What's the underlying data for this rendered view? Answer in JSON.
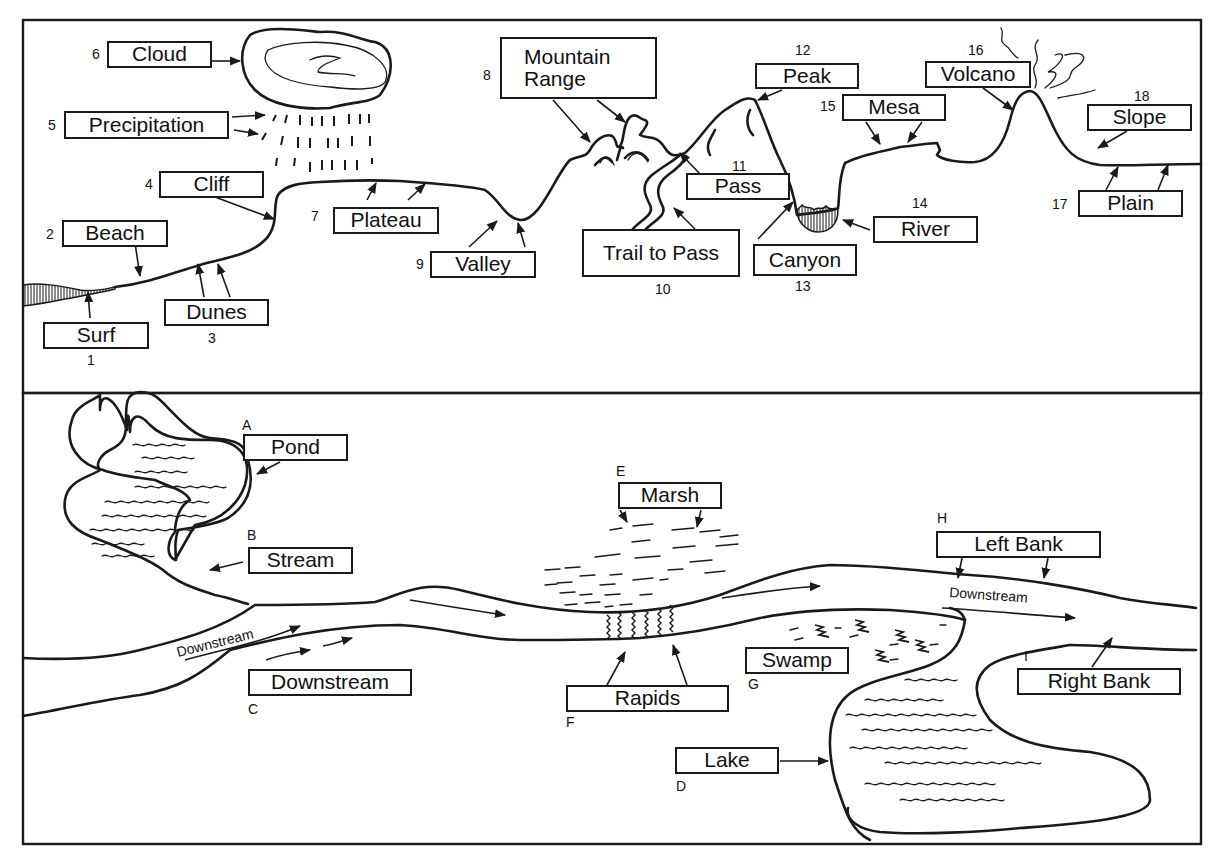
{
  "top_panel": {
    "labels": [
      {
        "num": "1",
        "text": "Surf"
      },
      {
        "num": "2",
        "text": "Beach"
      },
      {
        "num": "3",
        "text": "Dunes"
      },
      {
        "num": "4",
        "text": "Cliff"
      },
      {
        "num": "5",
        "text": "Precipitation"
      },
      {
        "num": "6",
        "text": "Cloud"
      },
      {
        "num": "7",
        "text": "Plateau"
      },
      {
        "num": "8",
        "text": "Mountain Range",
        "line1": "Mountain",
        "line2": "Range"
      },
      {
        "num": "9",
        "text": "Valley"
      },
      {
        "num": "10",
        "text": "Trail to Pass"
      },
      {
        "num": "11",
        "text": "Pass"
      },
      {
        "num": "12",
        "text": "Peak"
      },
      {
        "num": "13",
        "text": "Canyon"
      },
      {
        "num": "14",
        "text": "River"
      },
      {
        "num": "15",
        "text": "Mesa"
      },
      {
        "num": "16",
        "text": "Volcano"
      },
      {
        "num": "17",
        "text": "Plain"
      },
      {
        "num": "18",
        "text": "Slope"
      }
    ]
  },
  "bottom_panel": {
    "labels": [
      {
        "letter": "A",
        "text": "Pond"
      },
      {
        "letter": "B",
        "text": "Stream"
      },
      {
        "letter": "C",
        "text": "Downstream"
      },
      {
        "letter": "D",
        "text": "Lake"
      },
      {
        "letter": "E",
        "text": "Marsh"
      },
      {
        "letter": "F",
        "text": "Rapids"
      },
      {
        "letter": "G",
        "text": "Swamp"
      },
      {
        "letter": "H",
        "text": "Left Bank"
      },
      {
        "letter": "I",
        "text": "Right Bank"
      }
    ],
    "flow_annotations": [
      "Downstream",
      "Downstream"
    ]
  }
}
